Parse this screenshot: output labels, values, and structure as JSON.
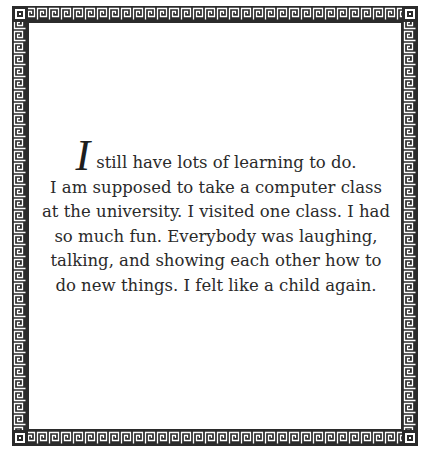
{
  "page": {
    "border": {
      "style": "greek-key-meander",
      "color": "#2b2b2b",
      "background": "#ffffff"
    },
    "passage": {
      "dropcap": "I",
      "lines": [
        "still have lots of learning to do.",
        "I am supposed to take a computer class",
        "at the university. I visited one class. I had",
        "so much fun. Everybody was laughing,",
        "talking, and showing each other how to",
        "do new things. I felt like a child again."
      ]
    }
  }
}
